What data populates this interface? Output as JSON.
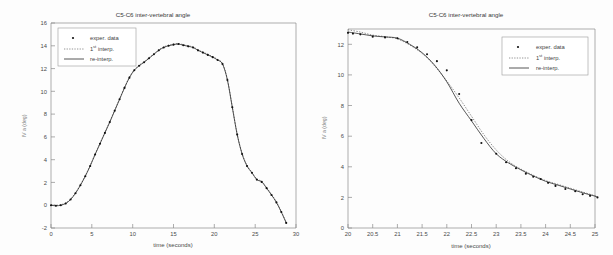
{
  "page": {
    "width": 613,
    "height": 255,
    "background": "#fdfdfd"
  },
  "figures": [
    {
      "id": "left",
      "name": "full-trial-plot",
      "title": "C5-C6 inter-vertebral angle",
      "xlabel": "time (seconds)",
      "ylabel": "IV a (deg)",
      "legend": {
        "position": "top-left",
        "items": [
          {
            "label": "exper. data",
            "marker": "dot",
            "color": "#111111"
          },
          {
            "label": "1st interp.",
            "label_main": "1",
            "label_sup": "st",
            "label_rest": " interp.",
            "marker": "dotted-line",
            "color": "#6e6e6e"
          },
          {
            "label": "re-interp.",
            "marker": "solid-line",
            "color": "#2b2b2b"
          }
        ]
      }
    },
    {
      "id": "right",
      "name": "zoomed-detail-plot",
      "title": "C5-C6 inter-vertebral angle",
      "xlabel": "time (seconds)",
      "ylabel": "IV a (deg)",
      "legend": {
        "position": "top-right",
        "items": [
          {
            "label": "exper. data",
            "marker": "dot",
            "color": "#111111"
          },
          {
            "label": "1st interp.",
            "label_main": "1",
            "label_sup": "st",
            "label_rest": " interp.",
            "marker": "dotted-line",
            "color": "#6e6e6e"
          },
          {
            "label": "re-interp.",
            "marker": "solid-line",
            "color": "#2b2b2b"
          }
        ]
      }
    }
  ],
  "chart_data": [
    {
      "type": "line",
      "id": "left",
      "title": "C5-C6 inter-vertebral angle",
      "xlabel": "time (seconds)",
      "ylabel": "IV a (deg)",
      "xlim": [
        0,
        30
      ],
      "ylim": [
        -2,
        16
      ],
      "xticks": [
        0,
        5,
        10,
        15,
        20,
        25,
        30
      ],
      "yticks": [
        -2,
        0,
        2,
        4,
        6,
        8,
        10,
        12,
        14,
        16
      ],
      "grid": false,
      "legend_position": "upper left",
      "series": [
        {
          "name": "exper. data",
          "style": "dots",
          "x": [
            0.0,
            0.6,
            1.2,
            1.8,
            2.4,
            3.0,
            3.6,
            4.2,
            4.8,
            5.4,
            6.0,
            6.6,
            7.2,
            7.8,
            8.4,
            9.0,
            9.6,
            10.2,
            10.8,
            11.4,
            12.0,
            12.6,
            13.2,
            13.8,
            14.4,
            15.0,
            15.6,
            16.2,
            16.8,
            17.4,
            18.0,
            18.6,
            19.2,
            19.8,
            20.4,
            21.0,
            21.6,
            22.2,
            22.8,
            23.4,
            24.0,
            24.6,
            25.2,
            25.8,
            26.4,
            27.0,
            27.6,
            28.2,
            28.8
          ],
          "y": [
            0.0,
            -0.05,
            0.0,
            0.15,
            0.5,
            1.05,
            1.75,
            2.55,
            3.45,
            4.45,
            5.4,
            6.35,
            7.3,
            8.3,
            9.3,
            10.3,
            11.2,
            11.85,
            12.25,
            12.55,
            12.9,
            13.25,
            13.6,
            13.85,
            14.0,
            14.1,
            14.15,
            14.05,
            13.95,
            13.85,
            13.6,
            13.4,
            13.2,
            13.0,
            12.75,
            12.4,
            11.0,
            8.6,
            6.2,
            4.5,
            3.45,
            2.85,
            2.25,
            2.05,
            1.5,
            0.9,
            0.25,
            -0.6,
            -1.55
          ]
        },
        {
          "name": "1st interp.",
          "style": "dotted",
          "note": "overlaps re-interp. at this scale"
        },
        {
          "name": "re-interp.",
          "style": "solid",
          "note": "overlaps exper. data at this scale"
        }
      ]
    },
    {
      "type": "line",
      "id": "right",
      "title": "C5-C6 inter-vertebral angle",
      "xlabel": "time (seconds)",
      "ylabel": "IV a (deg)",
      "xlim": [
        20,
        25
      ],
      "ylim": [
        0,
        13
      ],
      "xticks": [
        20,
        20.5,
        21,
        21.5,
        22,
        22.5,
        23,
        23.5,
        24,
        24.5,
        25
      ],
      "yticks": [
        0,
        2,
        4,
        6,
        8,
        10,
        12
      ],
      "grid": false,
      "legend_position": "upper right",
      "series": [
        {
          "name": "exper. data",
          "style": "dots",
          "x": [
            20.0,
            20.1,
            20.25,
            20.5,
            20.75,
            21.0,
            21.2,
            21.4,
            21.6,
            21.8,
            22.0,
            22.25,
            22.5,
            22.7,
            23.0,
            23.2,
            23.4,
            23.6,
            23.75,
            23.9,
            24.05,
            24.2,
            24.4,
            24.6,
            24.75,
            24.9,
            25.05
          ],
          "y": [
            12.75,
            12.7,
            12.65,
            12.5,
            12.45,
            12.4,
            12.15,
            11.8,
            11.35,
            10.9,
            10.3,
            8.75,
            7.05,
            5.55,
            4.85,
            4.3,
            3.9,
            3.55,
            3.35,
            3.2,
            2.95,
            2.75,
            2.55,
            2.4,
            2.2,
            2.1,
            2.0
          ]
        },
        {
          "name": "1st interp.",
          "style": "dotted",
          "x": [
            20.0,
            20.25,
            20.5,
            20.75,
            21.0,
            21.25,
            21.5,
            21.75,
            22.0,
            22.25,
            22.5,
            22.75,
            23.0,
            23.25,
            23.5,
            23.75,
            24.0,
            24.25,
            24.5,
            24.75,
            25.0,
            25.05
          ],
          "y": [
            12.95,
            12.8,
            12.6,
            12.5,
            12.35,
            11.95,
            11.4,
            10.6,
            9.6,
            8.5,
            7.3,
            6.1,
            5.1,
            4.35,
            3.85,
            3.45,
            3.1,
            2.85,
            2.6,
            2.35,
            2.1,
            2.0
          ]
        },
        {
          "name": "re-interp.",
          "style": "solid",
          "x": [
            20.0,
            20.25,
            20.5,
            20.75,
            21.0,
            21.25,
            21.5,
            21.75,
            22.0,
            22.25,
            22.5,
            22.75,
            23.0,
            23.25,
            23.5,
            23.75,
            24.0,
            24.25,
            24.5,
            24.75,
            25.0,
            25.05
          ],
          "y": [
            12.8,
            12.68,
            12.55,
            12.48,
            12.4,
            12.0,
            11.45,
            10.65,
            9.55,
            8.15,
            7.0,
            5.85,
            4.85,
            4.25,
            3.8,
            3.4,
            3.05,
            2.8,
            2.55,
            2.3,
            2.08,
            2.0
          ]
        }
      ]
    }
  ]
}
